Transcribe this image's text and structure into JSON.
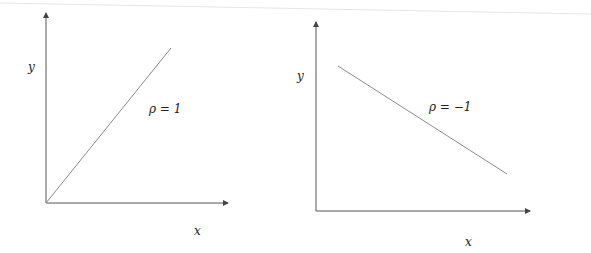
{
  "diagrams": [
    {
      "id": "positive-correlation",
      "x_label": "x",
      "y_label": "y",
      "annotation": "ρ = 1",
      "line": {
        "direction": "increasing",
        "start": [
          46,
          203
        ],
        "end": [
          171,
          48
        ]
      }
    },
    {
      "id": "negative-correlation",
      "x_label": "x",
      "y_label": "y",
      "annotation": "ρ = −1",
      "line": {
        "direction": "decreasing",
        "start": [
          338,
          66
        ],
        "end": [
          507,
          174
        ]
      }
    }
  ],
  "colors": {
    "axis": "#555555",
    "line": "#8a8a8a",
    "text": "#222222",
    "background": "#ffffff"
  }
}
